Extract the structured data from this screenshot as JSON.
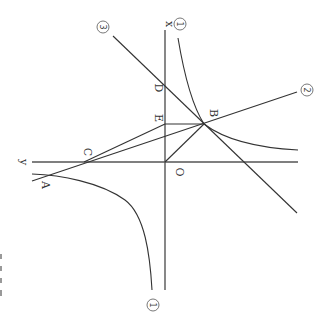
{
  "diagram": {
    "orientation": "rotated 90deg clockwise",
    "axes": {
      "x_label": "x",
      "y_label": "y",
      "origin_label": "O"
    },
    "points": {
      "A": "A",
      "B": "B",
      "C": "C",
      "D": "D",
      "E": "E"
    },
    "curve_labels": {
      "hyperbola": "①",
      "line2": "②",
      "line3": "③"
    },
    "colors": {
      "stroke": "#333333",
      "axis": "#555555",
      "background": "#ffffff"
    }
  }
}
